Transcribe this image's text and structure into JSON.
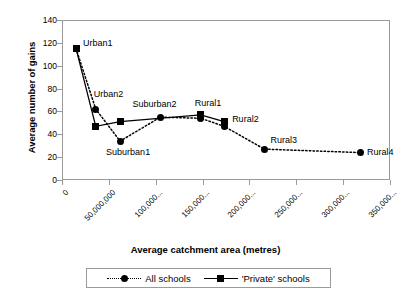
{
  "chart_data": {
    "type": "line",
    "title": "",
    "xlabel": "Average catchment area (metres)",
    "ylabel": "Average number of gains",
    "xlim": [
      0,
      350000000
    ],
    "ylim": [
      0,
      140
    ],
    "ytick_labels": [
      "140",
      "120",
      "100",
      "80",
      "60",
      "40",
      "20",
      "0"
    ],
    "ytick_values": [
      140,
      120,
      100,
      80,
      60,
      40,
      20,
      0
    ],
    "xtick_labels": [
      "0",
      "50,000,000",
      "100,000...",
      "150,000...",
      "200,000...",
      "250,000...",
      "300,000...",
      "350,000..."
    ],
    "xtick_values": [
      0,
      50000000,
      100000000,
      150000000,
      200000000,
      250000000,
      300000000,
      350000000
    ],
    "grid": false,
    "legend_position": "bottom",
    "point_labels": [
      {
        "text": "Urban1",
        "x": 15000000,
        "y": 115
      },
      {
        "text": "Urban2",
        "x": 36000000,
        "y": 62
      },
      {
        "text": "Suburban1",
        "x": 62000000,
        "y": 34
      },
      {
        "text": "Suburban2",
        "x": 105000000,
        "y": 55
      },
      {
        "text": "Rural1",
        "x": 148000000,
        "y": 54
      },
      {
        "text": "Rural2",
        "x": 173000000,
        "y": 47
      },
      {
        "text": "Rural3",
        "x": 216000000,
        "y": 27
      },
      {
        "text": "Rural4",
        "x": 318000000,
        "y": 24
      }
    ],
    "series": [
      {
        "name": "All schools",
        "marker": "circle",
        "linestyle": "dotted",
        "color": "#000000",
        "points": [
          {
            "label": "Urban1",
            "x": 15000000,
            "y": 115
          },
          {
            "label": "Urban2",
            "x": 36000000,
            "y": 62
          },
          {
            "label": "Suburban1",
            "x": 62000000,
            "y": 34
          },
          {
            "label": "Suburban2",
            "x": 105000000,
            "y": 55
          },
          {
            "label": "Rural1",
            "x": 148000000,
            "y": 54
          },
          {
            "label": "Rural2",
            "x": 173000000,
            "y": 47
          },
          {
            "label": "Rural3",
            "x": 216000000,
            "y": 27
          },
          {
            "label": "Rural4",
            "x": 318000000,
            "y": 24
          }
        ]
      },
      {
        "name": "'Private' schools",
        "marker": "square",
        "linestyle": "solid",
        "color": "#000000",
        "points": [
          {
            "label": "Urban1",
            "x": 15000000,
            "y": 115
          },
          {
            "label": "Urban2",
            "x": 36000000,
            "y": 47
          },
          {
            "label": "Suburban1",
            "x": 62000000,
            "y": 51
          },
          {
            "label": "Rural1",
            "x": 148000000,
            "y": 57
          },
          {
            "label": "Rural2",
            "x": 173000000,
            "y": 51
          }
        ]
      }
    ]
  },
  "legend": {
    "entries": [
      {
        "label": "All schools",
        "marker": "circle",
        "linestyle": "dotted"
      },
      {
        "label": "'Private' schools",
        "marker": "square",
        "linestyle": "solid"
      }
    ]
  }
}
